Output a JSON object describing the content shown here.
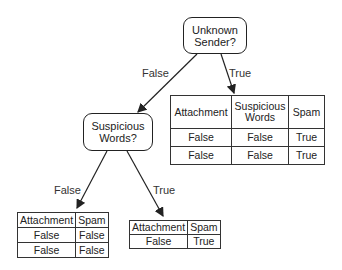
{
  "nodes": {
    "root": {
      "label_line1": "Unknown",
      "label_line2": "Sender?"
    },
    "child": {
      "label_line1": "Suspicious",
      "label_line2": "Words?"
    }
  },
  "edges": {
    "root_false": "False",
    "root_true": "True",
    "child_false": "False",
    "child_true": "True"
  },
  "tables": {
    "root_true": {
      "headers": [
        "Attachment",
        "Suspicious Words",
        "Spam"
      ],
      "rows": [
        [
          "False",
          "False",
          "True"
        ],
        [
          "False",
          "False",
          "True"
        ]
      ]
    },
    "child_false": {
      "headers": [
        "Attachment",
        "Spam"
      ],
      "rows": [
        [
          "False",
          "False"
        ],
        [
          "False",
          "False"
        ]
      ]
    },
    "child_true": {
      "headers": [
        "Attachment",
        "Spam"
      ],
      "rows": [
        [
          "False",
          "True"
        ]
      ]
    }
  }
}
